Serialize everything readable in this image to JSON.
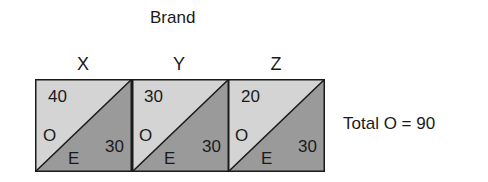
{
  "title": "Brand",
  "colors": {
    "observed": "#d4d4d4",
    "expected": "#9a9a9a",
    "border": "#1a1a1a"
  },
  "cells": [
    {
      "label": "X",
      "observed": "40",
      "expected": "30",
      "o_letter": "O",
      "e_letter": "E"
    },
    {
      "label": "Y",
      "observed": "30",
      "expected": "30",
      "o_letter": "O",
      "e_letter": "E"
    },
    {
      "label": "Z",
      "observed": "20",
      "expected": "30",
      "o_letter": "O",
      "e_letter": "E"
    }
  ],
  "total_text": "Total O = 90"
}
